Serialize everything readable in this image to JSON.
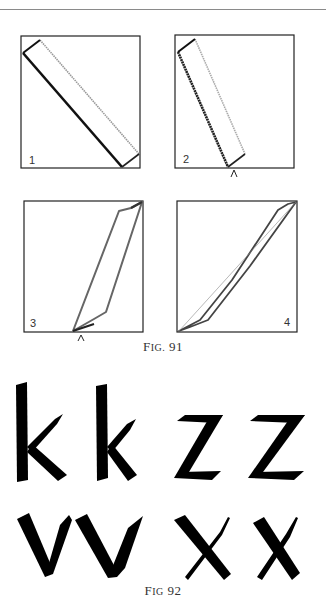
{
  "page": {
    "top_rule_color": "#8a8a8a"
  },
  "figure_91": {
    "caption_prefix": "F",
    "caption_smallcaps": "IG.",
    "caption_number": " 91",
    "panels": [
      {
        "label": "1",
        "description": "pen stroke diagonal, top-left to bottom-right"
      },
      {
        "label": "2",
        "description": "steeper stroke with pivot mark at bottom"
      },
      {
        "label": "3",
        "description": "stroke rising bottom to top-right, pivot mark at bottom"
      },
      {
        "label": "4",
        "description": "thin diagonal stroke from bottom-left to top-right"
      }
    ],
    "pivot_mark": "^"
  },
  "figure_92": {
    "caption_prefix": "F",
    "caption_smallcaps": "IG",
    "caption_number": " 92",
    "letters_row1": [
      "k",
      "k",
      "z",
      "z"
    ],
    "letters_row2": [
      "v",
      "v",
      "x",
      "x"
    ]
  }
}
